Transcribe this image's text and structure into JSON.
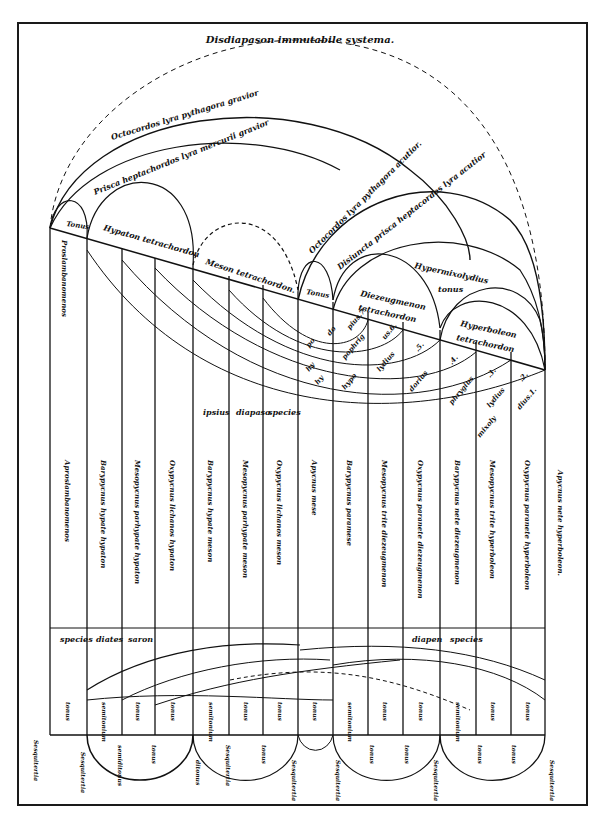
{
  "title": "Disdiapason immutabile systema.",
  "arc_labels": {
    "octochord_grave": "Octocordos lyra pythagora gravior",
    "heptachord_grave": "Prisca heptachordos lyra mercurii gravior",
    "octochord_acute": "Octocordos lyra pythagora acutior.",
    "heptachord_acute": "Disiuncta prisca heptacordos lyra acutior",
    "hypermixolydius": "Hypermixolydius",
    "hypermixolydius_2": "tonus"
  },
  "tetrachord_labels": {
    "tonus_left": "Tonus",
    "hypaton": "Hypaton tetrachordon",
    "meson": "Meson tetrachordon.",
    "tonus_mid": "Tonus",
    "diezeugmenon": "Diezeugmenon",
    "diezeugmenon_2": "tetrachordon",
    "hyperboleon": "Hyperboleon",
    "hyperboleon_2": "tetrachordon"
  },
  "mode_labels": [
    {
      "text": "hy",
      "x": 309,
      "y": 372
    },
    {
      "text": "po",
      "x": 309,
      "y": 348
    },
    {
      "text": "do",
      "x": 330,
      "y": 336
    },
    {
      "text": "pius.7.",
      "x": 350,
      "y": 330
    },
    {
      "text": "hy",
      "x": 318,
      "y": 385
    },
    {
      "text": "hypo",
      "x": 345,
      "y": 390
    },
    {
      "text": "pophrig",
      "x": 345,
      "y": 360
    },
    {
      "text": "us.6.",
      "x": 385,
      "y": 340
    },
    {
      "text": "lydius",
      "x": 380,
      "y": 372
    },
    {
      "text": ".5.",
      "x": 418,
      "y": 352
    },
    {
      "text": "dorius",
      "x": 412,
      "y": 392
    },
    {
      "text": ".4.",
      "x": 452,
      "y": 365
    },
    {
      "text": "phrygius",
      "x": 452,
      "y": 405
    },
    {
      "text": ".3.",
      "x": 490,
      "y": 378
    },
    {
      "text": "lydius",
      "x": 490,
      "y": 408
    },
    {
      "text": ".2.",
      "x": 522,
      "y": 382
    },
    {
      "text": "mixoly",
      "x": 480,
      "y": 438
    },
    {
      "text": "dius.1.",
      "x": 520,
      "y": 410
    }
  ],
  "species_row": [
    "ipsius",
    "diapaso",
    "species"
  ],
  "string_names": [
    "Proslambanomenos",
    "Hypate hypaton",
    "Parhypate hypaton",
    "Lichanos hypaton",
    "Hypate meson",
    "Parhypate meson",
    "Lichanos meson",
    "Mese",
    "Paramese",
    "Trite diezeugmenon",
    "Paranete diezeugmenon",
    "Nete diezeugmenon",
    "Trite hyperboleon",
    "Paranete hyperboleon",
    "Nete hyperboleon"
  ],
  "column_labels": [
    "Aproslambanomenos",
    "Barypycnus hypate hypaton",
    "Mesopycnus parhypate hypaton",
    "Oxypycnus lichanos hypaton",
    "Barypycnus hypate meson",
    "Mesopycnus parhypate meson",
    "Oxypycnus lichanos meson",
    "Apycnus mese",
    "Barypycnus paramese",
    "Mesopycnus trite diezeugmenon",
    "Oxypycnus paranete diezeugmenon",
    "Barypycnus nete diezeugmenon",
    "Mesopycnus trite hyperboleon",
    "Oxypycnus paranete hyperboleon",
    "Apycnus nete hyperboleon."
  ],
  "lower_band": {
    "left_header": [
      "species",
      "diates",
      "saron"
    ],
    "right_header": [
      "diapen",
      "species"
    ],
    "intervals": [
      "tonus",
      "semitonium",
      "tonus",
      "tonus",
      "semitonium",
      "tonus",
      "tonus",
      "tonus",
      "semitonium",
      "tonus",
      "tonus",
      "semitonium",
      "tonus",
      "tonus"
    ]
  },
  "bottom_labels": {
    "sesquitertia": "Sesquitertia",
    "ditonus": "ditonus",
    "tonus": "tonus",
    "semitonium": "semitonium",
    "semiditonus": "semiditonus"
  },
  "colors": {
    "ink": "#111111",
    "paper": "#ffffff"
  }
}
